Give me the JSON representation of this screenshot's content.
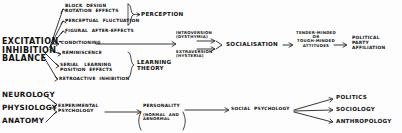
{
  "diagram": {
    "ink_color": "#141414",
    "background_color": "#fdfdfd",
    "row_top": {
      "root": "EXCITATION-\nINHIBITION\nBALANCE",
      "perception_items": [
        "BLOCK  DESIGN\nROTATION  EFFECTS",
        "PERCEPTUAL  FLUCTUATION",
        "FIGURAL  AFTER-EFFECTS"
      ],
      "perception_group": "PERCEPTION",
      "spine_item": "CONDITIONING",
      "learning_items": [
        "REMINISCENCE",
        "SERIAL   LEARNING\nPOSITION  EFFECTS",
        "RETROACTIVE  INHIBITION"
      ],
      "learning_group": "LEARNING\nTHEORY",
      "dimension_pair": [
        "INTROVERSION\n(DYSTHYMIA)",
        "EXTRAVERSION\n(HYSTERIA)"
      ],
      "socialisation": "SOCIALISATION",
      "attitudes": "TENDER-MINDED\nOR\nTOUGH-MINDED\nATTITUDES",
      "outcome": "POLITICAL\nPARTY\nAFFILIATION"
    },
    "row_bottom": {
      "basic_sciences": [
        "NEUROLOGY",
        "PHYSIOLOGY",
        "ANATOMY"
      ],
      "experimental": "EXPERIMENTAL\nPSYCHOLOGY",
      "personality": "PERSONALITY",
      "personality_qualifier": "(NORMAL  AND\nABNORMAL",
      "social_psychology": "SOCIAL  PSYCHOLOGY",
      "applied_fields": [
        "POLITICS",
        "SOCIOLOGY",
        "ANTHROPOLOGY"
      ]
    }
  }
}
